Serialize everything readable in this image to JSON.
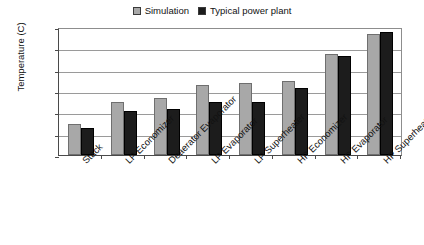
{
  "chart_data": {
    "type": "bar",
    "title": "",
    "xlabel": "",
    "ylabel": "Temperature (C)",
    "ylim": [
      0,
      600
    ],
    "ytick_step": 100,
    "yticks": [
      "600",
      "500",
      "400",
      "300",
      "200",
      "100",
      "0"
    ],
    "grid": "horizontal",
    "legend_position": "top-center",
    "categories": [
      "Stack",
      "LP Economizer",
      "Deaerator Evaporator",
      "LP Evaporator",
      "LP Superheater",
      "HP Economizer",
      "HP Evaporator",
      "HP Superheater"
    ],
    "series": [
      {
        "name": "Simulation",
        "color": "#a8a8a8",
        "values": [
          146,
          250,
          268,
          330,
          336,
          345,
          472,
          567
        ]
      },
      {
        "name": "Typical power plant",
        "color": "#1c1c1c",
        "values": [
          128,
          205,
          218,
          247,
          247,
          314,
          462,
          578
        ]
      }
    ]
  },
  "legend": {
    "items": [
      {
        "label": "Simulation",
        "swatch_color": "#a8a8a8",
        "icon": "legend-swatch-icon"
      },
      {
        "label": "Typical power plant",
        "swatch_color": "#1c1c1c",
        "icon": "legend-swatch-icon"
      }
    ]
  },
  "axes": {
    "y_title": "Temperature (C)"
  }
}
